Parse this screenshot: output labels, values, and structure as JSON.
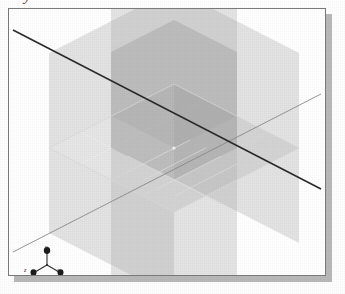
{
  "figure": {
    "caption_fragment": "y",
    "kind": "3d-isometric-viewport"
  },
  "viewport": {
    "background_color": "#ffffff",
    "border_color": "#7b7b7b",
    "shadow_color": "#b9b9b9",
    "width": 318,
    "height": 268
  },
  "scene": {
    "origin": {
      "x": 173,
      "y": 147
    },
    "planes": [
      {
        "name": "xz-plane-horizontal",
        "label": "horizontal ground plane",
        "color": "#c9c9c9",
        "opacity": 0.55,
        "gridded": true
      },
      {
        "name": "xy-plane-vertical",
        "label": "vertical plane front",
        "color": "#bdbdbd",
        "opacity": 0.5,
        "gridded": true
      },
      {
        "name": "yz-plane-vertical",
        "label": "vertical plane side",
        "color": "#b3b3b3",
        "opacity": 0.5,
        "gridded": true
      }
    ],
    "axis_lines": [
      {
        "name": "axis-line-major",
        "color": "#2a2a2a",
        "width": 1.4,
        "direction": "upper-left-to-lower-right"
      },
      {
        "name": "axis-line-minor",
        "color": "#8a8a8a",
        "width": 0.9,
        "direction": "lower-left-to-upper-right"
      }
    ],
    "grid": {
      "line_color": "#e8e8e8",
      "divisions": 4
    }
  },
  "axis_triad": {
    "name": "orientation-gizmo",
    "marker_color": "#202020",
    "stem_color": "#303030",
    "labels": {
      "x": "x",
      "y": "y",
      "z": "z"
    }
  }
}
